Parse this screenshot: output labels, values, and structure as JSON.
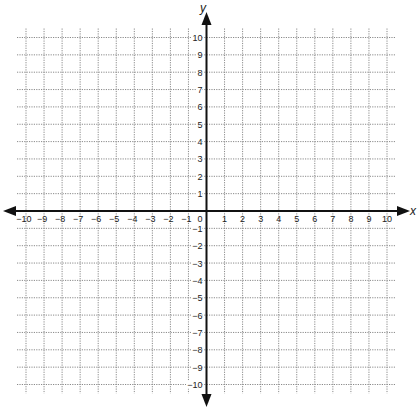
{
  "chart_data": {
    "type": "scatter",
    "title": "",
    "subtitle": "",
    "xlabel": "x",
    "ylabel": "y",
    "xlim": [
      -10,
      10
    ],
    "ylim": [
      -10,
      10
    ],
    "x_ticks": [
      -10,
      -9,
      -8,
      -7,
      -6,
      -5,
      -4,
      -3,
      -2,
      -1,
      0,
      1,
      2,
      3,
      4,
      5,
      6,
      7,
      8,
      9,
      10
    ],
    "y_ticks": [
      10,
      9,
      8,
      7,
      6,
      5,
      4,
      3,
      2,
      1,
      -1,
      -2,
      -3,
      -4,
      -5,
      -6,
      -7,
      -8,
      -9,
      -10
    ],
    "x_tick_labels": [
      "−10",
      "−9",
      "−8",
      "−7",
      "−6",
      "−5",
      "−4",
      "−3",
      "−2",
      "−1",
      "0",
      "1",
      "2",
      "3",
      "4",
      "5",
      "6",
      "7",
      "8",
      "9",
      "10"
    ],
    "y_tick_labels": [
      "10",
      "9",
      "8",
      "7",
      "6",
      "5",
      "4",
      "3",
      "2",
      "1",
      "−1",
      "−2",
      "−3",
      "−4",
      "−5",
      "−6",
      "−7",
      "−8",
      "−9",
      "−10"
    ],
    "origin_label": "0",
    "grid": true,
    "grid_style": "dotted",
    "grid_step": 1,
    "axes_arrows": true,
    "series": [],
    "legend": null
  },
  "colors": {
    "axis": "#111111",
    "grid": "#8a8a8a",
    "text": "#222222",
    "background": "#ffffff"
  }
}
